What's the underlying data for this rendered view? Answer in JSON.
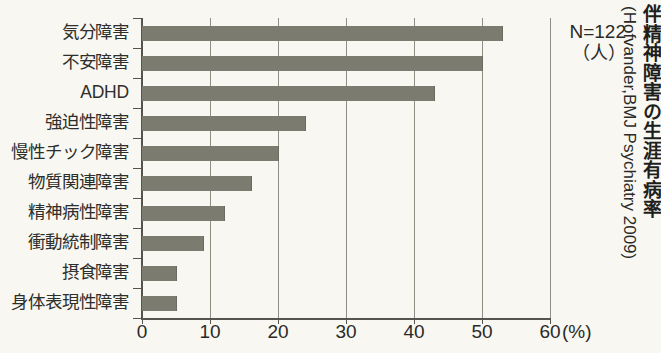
{
  "chart_data": {
    "type": "bar",
    "orientation": "horizontal",
    "title": "伴精神障害の生涯有病率",
    "citation": "(Hofvander,BMJ Psychiatry 2009)",
    "sample_note": "N=122",
    "sample_unit": "（人）",
    "xlabel": "(%)",
    "ylabel": "",
    "xlim": [
      0,
      60
    ],
    "grid": true,
    "legend": "none",
    "bar_color": "#7b7b70",
    "background_color": "#f8f7f1",
    "categories": [
      "気分障害",
      "不安障害",
      "ADHD",
      "強迫性障害",
      "慢性チック障害",
      "物質関連障害",
      "精神病性障害",
      "衝動統制障害",
      "摂食障害",
      "身体表現性障害"
    ],
    "values": [
      53,
      50,
      43,
      24,
      20,
      16,
      12,
      9,
      5,
      5
    ],
    "xticks": [
      0,
      10,
      20,
      30,
      40,
      50,
      60
    ],
    "xticklabels": [
      "0",
      "10",
      "20",
      "30",
      "40",
      "50",
      "60"
    ]
  }
}
